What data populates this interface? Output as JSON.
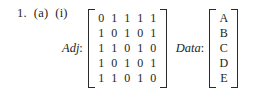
{
  "problem": {
    "number": "1.",
    "part": "(a)",
    "subpart": "(i)"
  },
  "adjacency": {
    "label": "Adj",
    "separator": ":",
    "rows": [
      [
        "0",
        "1",
        "1",
        "1",
        "1"
      ],
      [
        "1",
        "0",
        "1",
        "0",
        "1"
      ],
      [
        "1",
        "1",
        "0",
        "1",
        "0"
      ],
      [
        "1",
        "0",
        "1",
        "0",
        "1"
      ],
      [
        "1",
        "1",
        "0",
        "1",
        "0"
      ]
    ]
  },
  "data_vector": {
    "label": "Data",
    "separator": ":",
    "rows": [
      [
        "A"
      ],
      [
        "B"
      ],
      [
        "C"
      ],
      [
        "D"
      ],
      [
        "E"
      ]
    ]
  },
  "colors": {
    "ink": "#231f20",
    "bracket": "#2b2b2b",
    "page": "#ffffff"
  }
}
